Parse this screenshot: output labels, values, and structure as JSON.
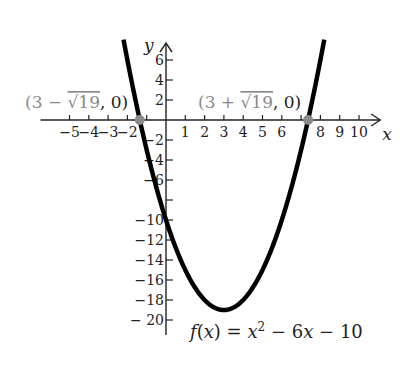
{
  "chart_data": {
    "type": "line",
    "title": "",
    "function_label": "f(x) = x² − 6x − 10",
    "function_label_parts": {
      "f": "f",
      "lp": "(",
      "x": "x",
      "rp": ")",
      "eq": " = ",
      "x2": "x",
      "sup": "2",
      "rest": " − 6",
      "x3": "x",
      "tail": " − 10"
    },
    "xlabel": "x",
    "ylabel": "y",
    "xlim": [
      -5.5,
      11
    ],
    "ylim": [
      -21,
      8
    ],
    "x_ticks": [
      -5,
      -4,
      -3,
      -2,
      -1,
      1,
      2,
      3,
      4,
      5,
      6,
      7,
      8,
      9,
      10
    ],
    "x_tick_labels": [
      "−5",
      "−4",
      "−3",
      "−2",
      "1",
      "2",
      "3",
      "4",
      "5",
      "6",
      "8",
      "9",
      "10"
    ],
    "x_tick_label_values": [
      -5,
      -4,
      -3,
      -2,
      1,
      2,
      3,
      4,
      5,
      6,
      8,
      9,
      10
    ],
    "y_ticks": [
      6,
      4,
      2,
      -2,
      -4,
      -6,
      -8,
      -10,
      -12,
      -14,
      -16,
      -18,
      -20
    ],
    "y_tick_labels": [
      "6",
      "4",
      "2",
      "−2",
      "−4",
      "−6",
      "−10",
      "−12",
      "−14",
      "−16",
      "−18",
      "− 20"
    ],
    "y_tick_label_values": [
      6,
      4,
      2,
      -2,
      -4,
      -6,
      -10,
      -12,
      -14,
      -16,
      -18,
      -20
    ],
    "grid": false,
    "series": [
      {
        "name": "f(x) = x^2 - 6x - 10",
        "a": 1,
        "b": -6,
        "c": -10,
        "x_range": [
          -2.2,
          8.2
        ],
        "color": "#000000"
      }
    ],
    "vertex": {
      "x": 3,
      "y": -19
    },
    "points": [
      {
        "label_prefix": "(3 − ",
        "label_root": "√19",
        "label_suffix": ", 0)",
        "x": -1.359,
        "y": 0,
        "color": "#8a8a8a"
      },
      {
        "label_prefix": "(3 + ",
        "label_root": "√19",
        "label_suffix": ", 0)",
        "x": 7.359,
        "y": 0,
        "color": "#8a8a8a"
      }
    ]
  },
  "colors": {
    "curve": "#000000",
    "axis": "#222222",
    "point": "#8a8a8a",
    "annotation": "#8a8a8a"
  }
}
